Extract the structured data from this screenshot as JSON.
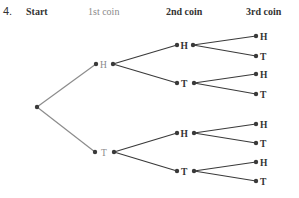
{
  "problem_number": "4.",
  "headers": {
    "start": "Start",
    "first": "1st coin",
    "second": "2nd coin",
    "third": "3rd coin"
  },
  "tree": {
    "first_level": [
      "H",
      "T"
    ],
    "second_level": [
      "H",
      "T",
      "H",
      "T"
    ],
    "third_level": [
      "H",
      "T",
      "H",
      "T",
      "H",
      "T",
      "H",
      "T"
    ]
  },
  "colors": {
    "first_branch": "#8c8c8c",
    "later_branch": "#3a3a3a",
    "node": "#3a3a3a"
  }
}
